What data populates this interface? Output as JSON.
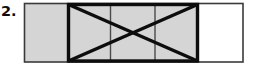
{
  "item": {
    "number_label": "2."
  },
  "figure": {
    "name": "partitioned-rectangle-with-x-overlay",
    "colors": {
      "shaded_fill": "#d5d5d5",
      "unshaded_fill": "#ffffff",
      "outer_stroke": "#3a3a3a",
      "bold_stroke": "#0d0d0d",
      "thin_divider": "#4a4a4a",
      "background": "#ffffff"
    },
    "outer_rectangle": {
      "x": 24.5,
      "y": 3.5,
      "width": 218.5,
      "height": 58.5,
      "stroke_width": 1.6
    },
    "shaded_region": {
      "x": 24.5,
      "y": 3.5,
      "width": 173.5,
      "height": 58.5
    },
    "unshaded_region": {
      "x": 198,
      "y": 3.5,
      "width": 45,
      "height": 58.5
    },
    "bold_box": {
      "x": 68.5,
      "y": 4.5,
      "width": 129,
      "height": 56.5,
      "stroke_width": 3.4
    },
    "x_overlay": {
      "diagonal_1": {
        "x1": 68.5,
        "y1": 4.5,
        "x2": 197.5,
        "y2": 61
      },
      "diagonal_2": {
        "x1": 68.5,
        "y1": 61,
        "x2": 197.5,
        "y2": 4.5
      },
      "stroke_width": 3.4,
      "crossing_point": {
        "x": 133,
        "y": 33
      }
    },
    "thin_dividers": [
      {
        "x": 110.5,
        "y1": 4.5,
        "y2": 61,
        "stroke_width": 1.4
      },
      {
        "x": 155.0,
        "y1": 4.5,
        "y2": 61,
        "stroke_width": 1.4
      }
    ]
  }
}
